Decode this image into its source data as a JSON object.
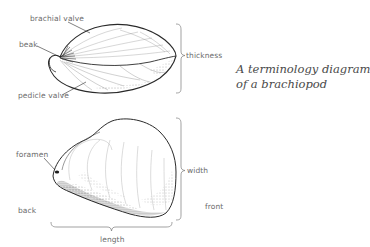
{
  "caption": {
    "line1": "A terminology diagram",
    "line2": "of a brachiopod"
  },
  "side_view": {
    "labels": {
      "brachial_valve": "brachial valve",
      "beak": "beak",
      "pedicle_valve": "pedicle valve",
      "thickness": "thickness"
    }
  },
  "top_view": {
    "labels": {
      "foramen": "foramen",
      "back": "back",
      "width": "width",
      "front": "front",
      "length": "length"
    }
  },
  "colors": {
    "ink": "#2a2a2a",
    "label": "#6b6b6b",
    "brace": "#7a7a7a",
    "background": "#ffffff"
  }
}
